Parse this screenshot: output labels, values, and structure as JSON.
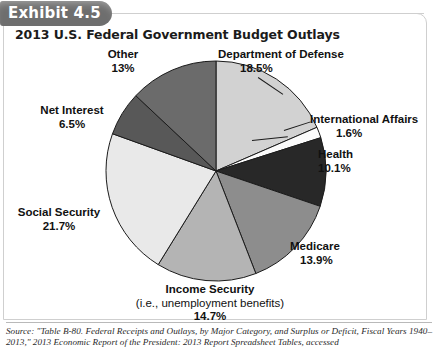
{
  "exhibit": {
    "tab_label": "Exhibit 4.5"
  },
  "chart_title": "2013 U.S. Federal Government Budget Outlays",
  "labels": {
    "other": {
      "name": "Other",
      "pct": "13%"
    },
    "dod": {
      "name": "Department of Defense",
      "pct": "18.5%"
    },
    "intl": {
      "name": "International Affairs",
      "pct": "1.6%"
    },
    "health": {
      "name": "Health",
      "pct": "10.1%"
    },
    "medicare": {
      "name": "Medicare",
      "pct": "13.9%"
    },
    "income": {
      "name": "Income Security",
      "sub": "(i.e., unemployment benefits)",
      "pct": "14.7%"
    },
    "social": {
      "name": "Social Security",
      "pct": "21.7%"
    },
    "interest": {
      "name": "Net Interest",
      "pct": "6.5%"
    }
  },
  "source_note": "Source: \"Table B-80. Federal Receipts and Outlays, by Major Category, and Surplus or Deficit, Fiscal Years 1940–2013,\" 2013 Economic Report of the President: 2013 Report Spreadsheet Tables, accessed",
  "chart_data": {
    "type": "pie",
    "title": "2013 U.S. Federal Government Budget Outlays",
    "unit": "percent of total federal outlays",
    "start_angle_deg": 0,
    "direction": "clockwise",
    "legend": "none (direct labels)",
    "categories": [
      "Department of Defense",
      "International Affairs",
      "Health",
      "Medicare",
      "Income Security",
      "Social Security",
      "Net Interest",
      "Other"
    ],
    "values": [
      18.5,
      1.6,
      10.1,
      13.9,
      14.7,
      21.7,
      6.5,
      13.0
    ],
    "value_labels": [
      "18.5%",
      "1.6%",
      "10.1%",
      "13.9%",
      "14.7%",
      "21.7%",
      "6.5%",
      "13%"
    ],
    "colors": [
      "#d2d2d2",
      "#fbfbfb",
      "#282828",
      "#8d8d8d",
      "#b4b4b4",
      "#e9e9e9",
      "#585858",
      "#6b6b6b"
    ],
    "slices": [
      {
        "label": "Department of Defense",
        "value": 18.5,
        "color": "#d2d2d2"
      },
      {
        "label": "International Affairs",
        "value": 1.6,
        "color": "#fbfbfb"
      },
      {
        "label": "Health",
        "value": 10.1,
        "color": "#282828"
      },
      {
        "label": "Medicare",
        "value": 13.9,
        "color": "#8d8d8d"
      },
      {
        "label": "Income Security",
        "value": 14.7,
        "color": "#b4b4b4"
      },
      {
        "label": "Social Security",
        "value": 21.7,
        "color": "#e9e9e9"
      },
      {
        "label": "Net Interest",
        "value": 6.5,
        "color": "#585858"
      },
      {
        "label": "Other",
        "value": 13.0,
        "color": "#6b6b6b"
      }
    ],
    "total": 100.0
  }
}
